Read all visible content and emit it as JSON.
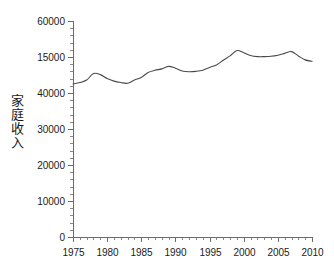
{
  "chart_data": {
    "type": "line",
    "title": "",
    "xlabel": "",
    "ylabel": "家庭收入",
    "xlim": [
      1975,
      2010
    ],
    "ylim": [
      0,
      60000
    ],
    "grid": false,
    "legend": null,
    "y_tick_labels": [
      "60000",
      "15000",
      "40000",
      "30000",
      "20000",
      "10000",
      "0"
    ],
    "y_tick_values": [
      60000,
      50000,
      40000,
      30000,
      20000,
      10000,
      0
    ],
    "y_minor_tick_step": 2000,
    "x_tick_labels": [
      "1975",
      "1980",
      "1985",
      "1990",
      "1995",
      "2000",
      "2005",
      "2010"
    ],
    "x_tick_values": [
      1975,
      1980,
      1985,
      1990,
      1995,
      2000,
      2005,
      2010
    ],
    "x_minor_tick_step": 1,
    "x": [
      1975,
      1976,
      1977,
      1978,
      1979,
      1980,
      1981,
      1982,
      1983,
      1984,
      1985,
      1986,
      1987,
      1988,
      1989,
      1990,
      1991,
      1992,
      1993,
      1994,
      1995,
      1996,
      1997,
      1998,
      1999,
      2000,
      2001,
      2002,
      2003,
      2004,
      2005,
      2006,
      2007,
      2008,
      2009,
      2010
    ],
    "series": [
      {
        "name": "家庭収入",
        "color": "#4a4a4a",
        "values": [
          42500,
          42900,
          43600,
          45400,
          45100,
          44000,
          43300,
          42900,
          42700,
          43600,
          44300,
          45700,
          46300,
          46700,
          47400,
          46900,
          46100,
          45900,
          46000,
          46300,
          47100,
          47800,
          49100,
          50300,
          51800,
          51200,
          50400,
          50100,
          50100,
          50200,
          50500,
          51000,
          51500,
          50300,
          49200,
          48800
        ]
      }
    ]
  },
  "axes": {
    "y_axis_name": "y-axis",
    "x_axis_name": "x-axis"
  }
}
